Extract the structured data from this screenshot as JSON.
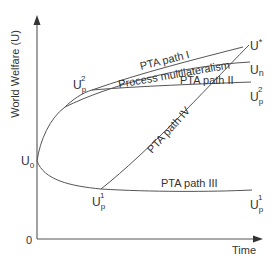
{
  "figure": {
    "y_axis_label": "World Welfare (U)",
    "x_axis_label": "Time",
    "origin_label": "0",
    "points": {
      "u0": {
        "base": "U",
        "sub": "0"
      },
      "up1_min": {
        "base": "U",
        "sub": "p",
        "sup": "1"
      },
      "up2_branch": {
        "base": "U",
        "sub": "p",
        "sup": "2"
      },
      "ustar_end": {
        "base": "U",
        "sup": "*"
      },
      "un_end": {
        "base": "U",
        "sub": "n"
      },
      "up2_end": {
        "base": "U",
        "sub": "p",
        "sup": "2"
      },
      "up1_end": {
        "base": "U",
        "sub": "p",
        "sup": "1"
      }
    },
    "paths": {
      "pta_path_1": "PTA path I",
      "multilateralism": "Process multilateralism",
      "pta_path_2": "PTA path II",
      "pta_path_3": "PTA path III",
      "pta_path_4": "PTA path IV"
    },
    "colors": {
      "line": "#555555",
      "text": "#333333",
      "background": "#ffffff"
    }
  }
}
